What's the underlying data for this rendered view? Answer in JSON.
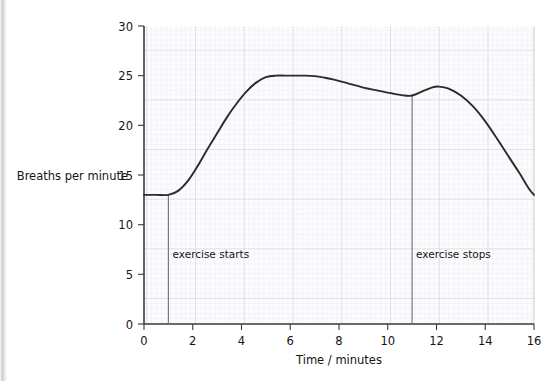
{
  "chart_data": {
    "type": "line",
    "title": "",
    "xlabel": "Time / minutes",
    "ylabel": "Breaths per minute",
    "xlim": [
      0,
      16
    ],
    "ylim": [
      0,
      30
    ],
    "xticks": [
      0,
      2,
      4,
      6,
      8,
      10,
      12,
      14,
      16
    ],
    "xtick_labels": [
      "0",
      "2",
      "4",
      "6",
      "8",
      "10",
      "12",
      "14",
      "16"
    ],
    "yticks": [
      0,
      5,
      10,
      15,
      20,
      25,
      30
    ],
    "ytick_labels": [
      "0",
      "5",
      "10",
      "15",
      "20",
      "25",
      "30"
    ],
    "grid": true,
    "grid_minor_x_step": 0.2,
    "grid_minor_y_step": 0.5,
    "grid_major_x_step": 2,
    "grid_major_y_step": 5,
    "legend": "none",
    "series": [
      {
        "name": "Breathing rate",
        "color": "#2b2b2b",
        "x": [
          0.0,
          0.5,
          1.0,
          1.4,
          1.8,
          2.2,
          2.6,
          3.0,
          3.4,
          3.8,
          4.2,
          4.6,
          5.0,
          5.4,
          6.0,
          6.6,
          7.0,
          7.4,
          7.8,
          8.4,
          9.0,
          9.6,
          10.2,
          10.7,
          11.0,
          11.4,
          11.8,
          12.1,
          12.5,
          13.0,
          13.5,
          14.0,
          14.5,
          15.0,
          15.4,
          15.8,
          16.0
        ],
        "y": [
          13.0,
          13.0,
          13.0,
          13.4,
          14.4,
          15.9,
          17.6,
          19.2,
          20.8,
          22.2,
          23.4,
          24.3,
          24.85,
          25.0,
          25.0,
          25.0,
          24.95,
          24.8,
          24.6,
          24.2,
          23.8,
          23.5,
          23.2,
          23.0,
          23.0,
          23.4,
          23.8,
          23.9,
          23.7,
          23.0,
          21.9,
          20.4,
          18.6,
          16.7,
          15.2,
          13.6,
          13.0
        ]
      }
    ],
    "annotations": [
      {
        "name": "exercise-starts",
        "label": "exercise starts",
        "x": 1,
        "y_top": 13.0,
        "y_bottom": 0,
        "label_x": 1.35,
        "label_y": 6.6
      },
      {
        "name": "exercise-stops",
        "label": "exercise stops",
        "x": 11,
        "y_top": 23.0,
        "y_bottom": 0,
        "label_x": 11.35,
        "label_y": 6.6
      }
    ],
    "colors": {
      "curve": "#2b2b2b",
      "axis": "#3a3a3a",
      "grid_major": "#c6c8cf",
      "grid_minor": "#e6e7ec",
      "annotation_line": "#6d6f75",
      "background": "#ffffff",
      "plot_background": "#fbfbfd"
    }
  }
}
